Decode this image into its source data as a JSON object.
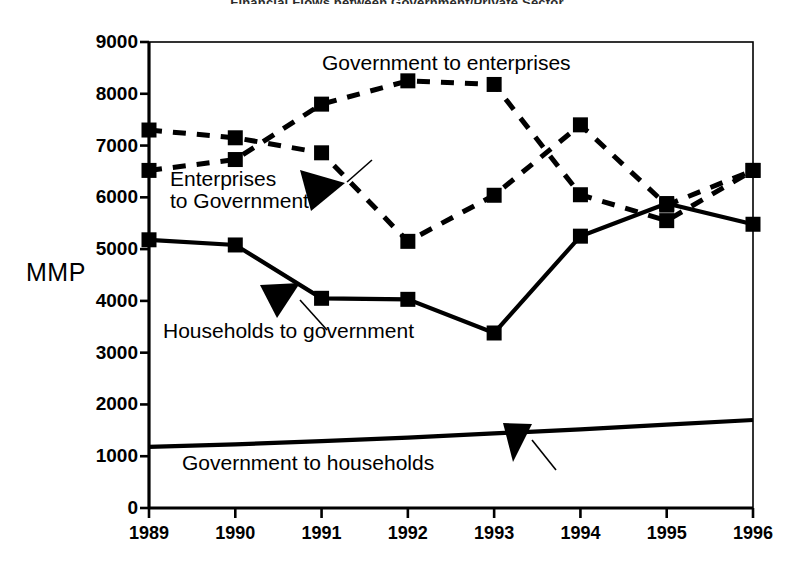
{
  "title": "Financial Flows between Government/Private Sector",
  "axis": {
    "ylabel": "MMP",
    "yticks": [
      "0",
      "1000",
      "2000",
      "3000",
      "4000",
      "5000",
      "6000",
      "7000",
      "8000",
      "9000"
    ],
    "xticks": [
      "1989",
      "1990",
      "1991",
      "1992",
      "1993",
      "1994",
      "1995",
      "1996"
    ]
  },
  "labels": {
    "gov_to_enterprises": "Government to  enterprises",
    "enterprises_to_government": "Enterprises\nto Government",
    "households_to_government": "Households to government",
    "government_to_households": "Government to households"
  },
  "colors": {
    "line": "#000000",
    "frame": "#000000",
    "background": "#ffffff"
  },
  "chart_data": {
    "type": "line",
    "title": "Financial Flows between Government/Private Sector",
    "xlabel": "",
    "ylabel": "MMP",
    "x": [
      "1989",
      "1990",
      "1991",
      "1992",
      "1993",
      "1994",
      "1995",
      "1996"
    ],
    "ylim": [
      0,
      9000
    ],
    "xlim": [
      "1989",
      "1996"
    ],
    "grid": false,
    "legend": "annotations-on-plot",
    "series": [
      {
        "name": "Government to  enterprises",
        "style": "dashed",
        "marker": "square",
        "values": [
          6520,
          6730,
          7800,
          8250,
          8180,
          6050,
          5550,
          6520
        ]
      },
      {
        "name": "Enterprises to Government",
        "style": "dashed",
        "marker": "square",
        "values": [
          7300,
          7150,
          6860,
          5150,
          6040,
          7400,
          5850,
          6520
        ]
      },
      {
        "name": "Households to government",
        "style": "solid",
        "marker": "square",
        "values": [
          5180,
          5080,
          4050,
          4030,
          3380,
          5250,
          5880,
          5480
        ]
      },
      {
        "name": "Government to households",
        "style": "solid",
        "marker": "none",
        "values": [
          1180,
          1230,
          1290,
          1360,
          1440,
          1520,
          1610,
          1700
        ]
      }
    ]
  }
}
